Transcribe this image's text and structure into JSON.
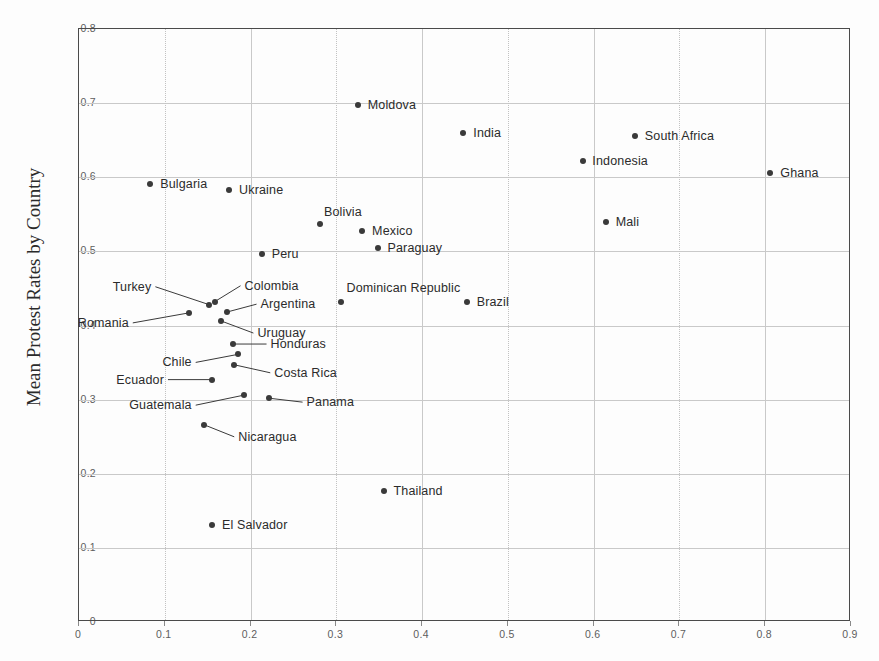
{
  "chart_data": {
    "type": "scatter",
    "title": "",
    "ylabel": "Mean Protest Rates by Country",
    "xlabel": "",
    "xlim": [
      0,
      0.9
    ],
    "ylim": [
      0,
      0.8
    ],
    "xticks": [
      "0",
      "0.1",
      "0.2",
      "0.3",
      "0.4",
      "0.5",
      "0.6",
      "0.7",
      "0.8",
      "0.9"
    ],
    "yticks": [
      "0",
      "0.1",
      "0.2",
      "0.3",
      "0.4",
      "0.5",
      "0.6",
      "0.7",
      "0.8"
    ],
    "grid": true,
    "legend": "none",
    "points": [
      {
        "label": "Moldova",
        "x": 0.325,
        "y": 0.697,
        "anchor": "right",
        "dx": 10,
        "dy": 0
      },
      {
        "label": "India",
        "x": 0.448,
        "y": 0.66,
        "anchor": "right",
        "dx": 10,
        "dy": 0
      },
      {
        "label": "South Africa",
        "x": 0.648,
        "y": 0.655,
        "anchor": "right",
        "dx": 10,
        "dy": 0
      },
      {
        "label": "Indonesia",
        "x": 0.588,
        "y": 0.622,
        "anchor": "right",
        "dx": 9,
        "dy": 0
      },
      {
        "label": "Ghana",
        "x": 0.806,
        "y": 0.606,
        "anchor": "right",
        "dx": 10,
        "dy": 0
      },
      {
        "label": "Bulgaria",
        "x": 0.083,
        "y": 0.591,
        "anchor": "right",
        "dx": 10,
        "dy": 0
      },
      {
        "label": "Ukraine",
        "x": 0.175,
        "y": 0.583,
        "anchor": "right",
        "dx": 10,
        "dy": 0
      },
      {
        "label": "Mali",
        "x": 0.614,
        "y": 0.54,
        "anchor": "right",
        "dx": 10,
        "dy": 0
      },
      {
        "label": "Bolivia",
        "x": 0.281,
        "y": 0.537,
        "anchor": "right",
        "dx": 4,
        "dy": -12
      },
      {
        "label": "Mexico",
        "x": 0.33,
        "y": 0.528,
        "anchor": "right",
        "dx": 10,
        "dy": 0
      },
      {
        "label": "Paraguay",
        "x": 0.348,
        "y": 0.505,
        "anchor": "right",
        "dx": 10,
        "dy": 0
      },
      {
        "label": "Peru",
        "x": 0.213,
        "y": 0.497,
        "anchor": "right",
        "dx": 10,
        "dy": 0
      },
      {
        "label": "Brazil",
        "x": 0.452,
        "y": 0.432,
        "anchor": "right",
        "dx": 10,
        "dy": 0
      },
      {
        "label": "Dominican Republic",
        "x": 0.306,
        "y": 0.432,
        "anchor": "right",
        "dx": 5,
        "dy": -14
      },
      {
        "label": "Turkey",
        "x": 0.152,
        "y": 0.428,
        "anchor": "leader",
        "dx": -58,
        "dy": -18
      },
      {
        "label": "Colombia",
        "x": 0.158,
        "y": 0.432,
        "anchor": "leader",
        "dx": 30,
        "dy": -16
      },
      {
        "label": "Romania",
        "x": 0.128,
        "y": 0.417,
        "anchor": "leader",
        "dx": -60,
        "dy": 10
      },
      {
        "label": "Argentina",
        "x": 0.172,
        "y": 0.418,
        "anchor": "leader",
        "dx": 34,
        "dy": -8
      },
      {
        "label": "Uruguay",
        "x": 0.166,
        "y": 0.406,
        "anchor": "leader",
        "dx": 36,
        "dy": 12
      },
      {
        "label": "Honduras",
        "x": 0.179,
        "y": 0.375,
        "anchor": "leader",
        "dx": 38,
        "dy": 0
      },
      {
        "label": "Chile",
        "x": 0.185,
        "y": 0.361,
        "anchor": "leader",
        "dx": -46,
        "dy": 8
      },
      {
        "label": "Costa Rica",
        "x": 0.181,
        "y": 0.347,
        "anchor": "leader",
        "dx": 40,
        "dy": 8
      },
      {
        "label": "Ecuador",
        "x": 0.155,
        "y": 0.327,
        "anchor": "leader",
        "dx": -48,
        "dy": 0
      },
      {
        "label": "Guatemala",
        "x": 0.192,
        "y": 0.306,
        "anchor": "leader",
        "dx": -52,
        "dy": 10
      },
      {
        "label": "Panama",
        "x": 0.221,
        "y": 0.302,
        "anchor": "leader",
        "dx": 38,
        "dy": 4
      },
      {
        "label": "Nicaragua",
        "x": 0.146,
        "y": 0.266,
        "anchor": "leader",
        "dx": 34,
        "dy": 12
      },
      {
        "label": "Thailand",
        "x": 0.355,
        "y": 0.177,
        "anchor": "right",
        "dx": 10,
        "dy": 0
      },
      {
        "label": "El Salvador",
        "x": 0.155,
        "y": 0.131,
        "anchor": "right",
        "dx": 10,
        "dy": 0
      }
    ],
    "colors": {
      "marker": "#3a3a3a",
      "grid": "#c9c9c9",
      "axis": "#4a4a4a",
      "text": "#2b2b2b",
      "background": "#fdfdfd"
    }
  }
}
